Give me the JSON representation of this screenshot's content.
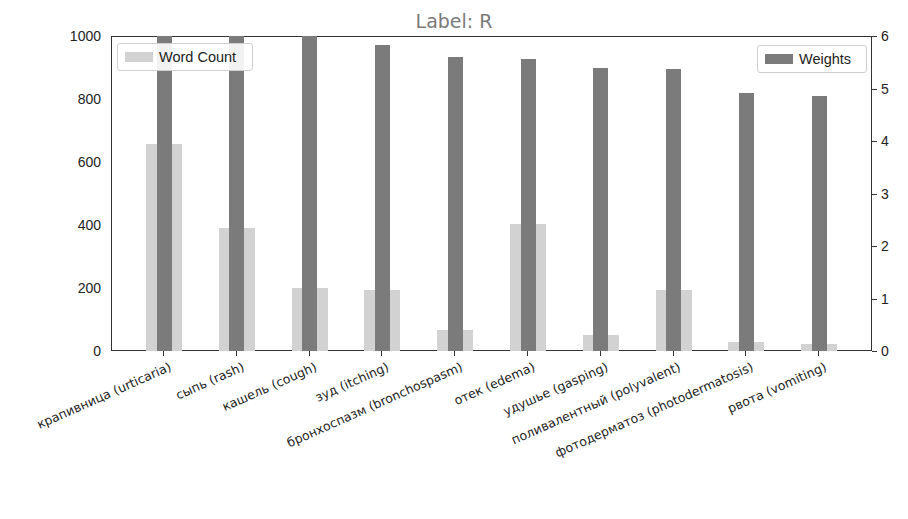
{
  "chart_data": {
    "type": "bar",
    "title": "Label: R",
    "xlabel": "",
    "ylabel": "",
    "y2label": "",
    "categories": [
      "крапивница (urticaria)",
      "сыпь (rash)",
      "кашель (cough)",
      "зуд (itching)",
      "бронхоспазм (bronchospasm)",
      "отек (edema)",
      "удушье (gasping)",
      "поливалентный (polyvalent)",
      "фотодерматоз (photodermatosis)",
      "рвота (vomiting)"
    ],
    "series": [
      {
        "name": "Word Count",
        "axis": "left",
        "color": "#d2d2d2",
        "values": [
          656,
          389,
          201,
          194,
          67,
          404,
          51,
          194,
          29,
          22
        ]
      },
      {
        "name": "Weights",
        "axis": "right",
        "color": "#7b7b7b",
        "values": [
          6.3,
          6.2,
          6.0,
          5.83,
          5.6,
          5.56,
          5.39,
          5.37,
          4.91,
          4.86
        ]
      }
    ],
    "ylim": [
      0,
      1000
    ],
    "y2lim": [
      0,
      6
    ],
    "yticks": [
      "0",
      "200",
      "400",
      "600",
      "800",
      "1000"
    ],
    "y2ticks": [
      "0",
      "1",
      "2",
      "3",
      "4",
      "5",
      "6"
    ],
    "legend": [
      {
        "label": "Word Count",
        "position": "upper left"
      },
      {
        "label": "Weights",
        "position": "upper right"
      }
    ],
    "grid": false
  }
}
